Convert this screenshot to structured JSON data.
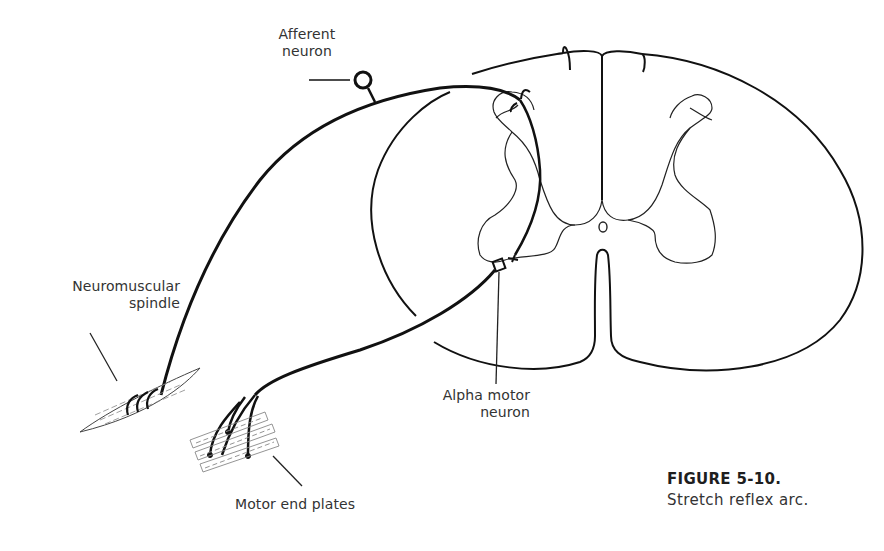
{
  "figure": {
    "number": "FIGURE 5-10.",
    "caption": "Stretch reflex arc."
  },
  "labels": {
    "afferent_neuron": {
      "line1": "Afferent",
      "line2": "neuron"
    },
    "neuromuscular_spindle": {
      "line1": "Neuromuscular",
      "line2": "spindle"
    },
    "alpha_motor_neuron": {
      "line1": "Alpha motor",
      "line2": "neuron"
    },
    "motor_end_plates": "Motor end plates"
  },
  "colors": {
    "stroke": "#111111",
    "thin_stroke": "#333333",
    "muscle_stroke": "#777777",
    "background": "#ffffff"
  }
}
